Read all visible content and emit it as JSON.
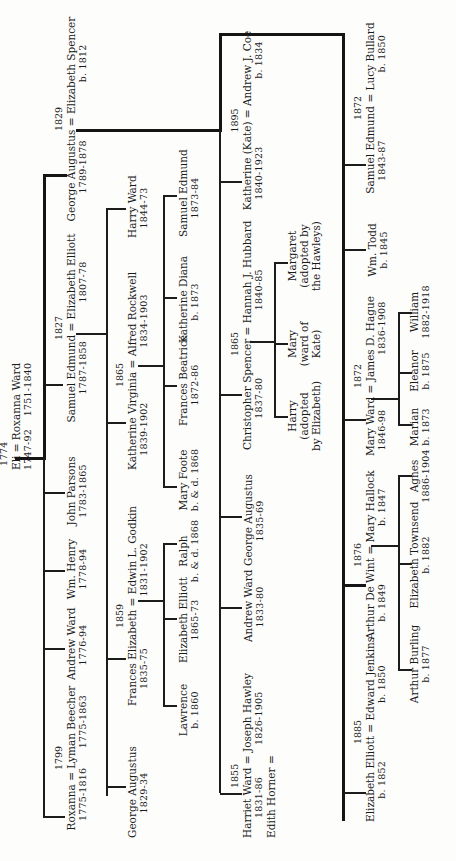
{
  "tree": {
    "root": {
      "marriage_year": "1774",
      "husband": "Eli",
      "wife": "Roxanna Ward",
      "husband_dates": "1747-92",
      "wife_dates": "1751-1840"
    },
    "gen2": [
      {
        "marriage_year": "1799",
        "spouse1": "Roxanna",
        "spouse2": "Lyman Beecher",
        "dates1": "1775-1816",
        "dates2": "1775-1863"
      },
      {
        "name": "Andrew Ward",
        "dates": "1776-94"
      },
      {
        "name": "Wm. Henry",
        "dates": "1778-94"
      },
      {
        "name": "John Parsons",
        "dates": "1783-1865"
      },
      {
        "marriage_year": "1827",
        "spouse1": "Samuel Edmund",
        "spouse2": "Elizabeth Elliott",
        "dates1": "1787-1858",
        "dates2": "1807-78"
      },
      {
        "marriage_year": "1829",
        "spouse1": "George Augustus",
        "spouse2": "Elizabeth Spencer",
        "dates1": "1789-1878",
        "dates2": "b. 1812"
      }
    ],
    "samuel_children": [
      {
        "name": "George Augustus",
        "dates": "1829-34"
      },
      {
        "marriage_year": "1859",
        "spouse1": "Frances Elizabeth",
        "spouse2": "Edwin L. Godkin",
        "dates1": "1835-75",
        "dates2": "1831-1902"
      },
      {
        "marriage_year": "1865",
        "spouse1": "Katherine Virginia",
        "spouse2": "Alfred Rockwell",
        "dates1": "1839-1902",
        "dates2": "1834-1903"
      },
      {
        "name": "Harry Ward",
        "dates": "1844-73"
      }
    ],
    "frances_children": [
      {
        "name": "Lawrence",
        "dates": "b. 1860"
      },
      {
        "name": "Elizabeth Elliott",
        "dates": "1865-73"
      },
      {
        "name": "Ralph",
        "dates": "b. & d. 1868"
      }
    ],
    "katherine_v_children": [
      {
        "name": "Mary Foote",
        "dates": "b. & d. 1868"
      },
      {
        "name": "Frances Beatrice",
        "dates": "1872-86"
      },
      {
        "name": "Katherine Diana",
        "dates": "b. 1873"
      },
      {
        "name": "Samuel Edmund",
        "dates": "1873-84"
      }
    ],
    "george_children": [
      {
        "marriage_year": "1855",
        "spouse1": "Harriet Ward",
        "spouse2": "Joseph Hawley",
        "dates1": "1831-86",
        "dates2": "1826-1905",
        "extra": "Edith Horner ="
      },
      {
        "name": "Andrew Ward",
        "dates": "1833-80"
      },
      {
        "name": "George Augustus",
        "dates": "1835-69"
      },
      {
        "marriage_year": "1865",
        "spouse1": "Christopher Spencer",
        "spouse2": "Hannah J. Hubbard",
        "dates1": "1837-80",
        "dates2": "1840-85"
      },
      {
        "marriage_year": "1895",
        "spouse1": "Katherine (Kate)",
        "spouse2": "Andrew J. Coe",
        "dates1": "1840-1923",
        "dates2": "b. 1834"
      }
    ],
    "christopher_children": [
      {
        "name": "Harry",
        "note1": "(adopted",
        "note2": "by Elizabeth)"
      },
      {
        "name": "Mary",
        "note1": "(ward of",
        "note2": "Kate)"
      },
      {
        "name": "Margaret",
        "note1": "(adopted by",
        "note2": "the Hawleys)"
      }
    ],
    "george_second_children": [
      {
        "marriage_year": "1885",
        "spouse1": "Elizabeth Elliott",
        "spouse2": "Edward Jenkins",
        "dates1": "b. 1852",
        "dates2": "b. 1850"
      },
      {
        "marriage_year": "1876",
        "spouse1": "Arthur De Wint",
        "spouse2": "Mary Hallock",
        "dates1": "b. 1849",
        "dates2": "b. 1847"
      },
      {
        "marriage_year": "1872",
        "spouse1": "Mary Ward",
        "spouse2": "James D. Hague",
        "dates1": "1846-98",
        "dates2": "1836-1908"
      },
      {
        "name": "Wm. Todd",
        "dates": "b. 1845"
      },
      {
        "marriage_year": "1872",
        "spouse1": "Samuel Edmund",
        "spouse2": "Lucy Bullard",
        "dates1": "1843-87",
        "dates2": "b. 1850"
      }
    ],
    "arthur_children": [
      {
        "name": "Arthur Burling",
        "dates": "b. 1877"
      },
      {
        "name": "Elizabeth Townsend",
        "dates": "b. 1882"
      },
      {
        "name": "Agnes",
        "dates": "1886-1904"
      }
    ],
    "mary_children": [
      {
        "name": "Marian",
        "dates": "b. 1873"
      },
      {
        "name": "Eleanor",
        "dates": "b. 1875"
      },
      {
        "name": "William",
        "dates": "1882-1918"
      }
    ]
  }
}
